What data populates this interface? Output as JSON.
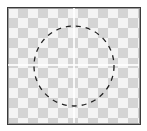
{
  "canvas": {
    "background": "transparency-checkerboard",
    "checker_light": "#f4f4f4",
    "checker_dark": "#d4d4d4",
    "border_color": "#3a3a3a"
  },
  "guides": {
    "color": "#ffffff",
    "orientation": [
      "vertical",
      "horizontal"
    ]
  },
  "selection": {
    "shape": "ellipse",
    "style": "dashed",
    "stroke_color": "#222222"
  }
}
